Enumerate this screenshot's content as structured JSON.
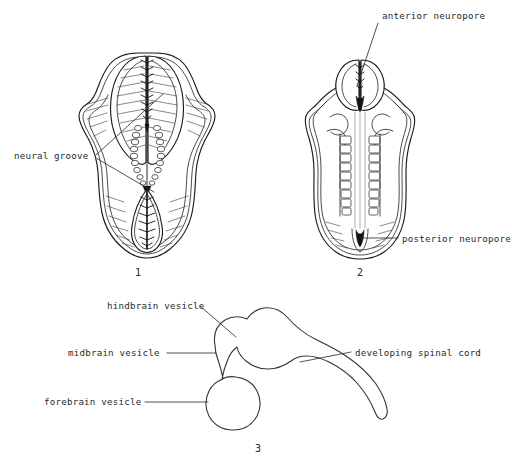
{
  "page": {
    "background_color": "#ffffff",
    "ink_color": "#1a1a1a",
    "width": 512,
    "height": 467
  },
  "figures": [
    {
      "id": "figure-1",
      "number": "1",
      "caption": "1",
      "description": "dorsal view of embryo with open neural groove and neural folds",
      "labels": [
        {
          "id": "neural-groove",
          "text": "neural groove",
          "text_x": 14,
          "text_y": 159,
          "anchor": "start",
          "leaders": [
            {
              "x1": 96,
              "y1": 155,
              "x2": 163,
              "y2": 94
            },
            {
              "x1": 96,
              "y1": 158,
              "x2": 154,
              "y2": 192
            }
          ]
        }
      ]
    },
    {
      "id": "figure-2",
      "number": "2",
      "caption": "2",
      "description": "dorsal view of embryo with closing neural tube, somites and neuropores",
      "labels": [
        {
          "id": "anterior-neuropore",
          "text": "anterior neuropore",
          "text_x": 382,
          "text_y": 19,
          "anchor": "start",
          "leaders": [
            {
              "x1": 378,
              "y1": 23,
              "x2": 357,
              "y2": 86
            }
          ]
        },
        {
          "id": "posterior-neuropore",
          "text": "posterior neuropore",
          "text_x": 402,
          "text_y": 242,
          "anchor": "start",
          "leaders": [
            {
              "x1": 398,
              "y1": 238,
              "x2": 360,
              "y2": 238
            }
          ]
        }
      ]
    },
    {
      "id": "figure-3",
      "number": "3",
      "caption": "3",
      "description": "lateral view of developing brain vesicles and spinal cord",
      "labels": [
        {
          "id": "hindbrain-vesicle",
          "text": "hindbrain vesicle",
          "text_x": 107,
          "text_y": 309,
          "anchor": "start",
          "leaders": [
            {
              "x1": 200,
              "y1": 306,
              "x2": 236,
              "y2": 337
            }
          ]
        },
        {
          "id": "midbrain-vesicle",
          "text": "midbrain vesicle",
          "text_x": 68,
          "text_y": 356,
          "anchor": "start",
          "leaders": [
            {
              "x1": 167,
              "y1": 353,
              "x2": 216,
              "y2": 353
            }
          ]
        },
        {
          "id": "forebrain-vesicle",
          "text": "forebrain vesicle",
          "text_x": 44,
          "text_y": 405,
          "anchor": "start",
          "leaders": [
            {
              "x1": 145,
              "y1": 402,
              "x2": 208,
              "y2": 402
            }
          ]
        },
        {
          "id": "developing-spinal-cord",
          "text": "developing spinal cord",
          "text_x": 355,
          "text_y": 356,
          "anchor": "start",
          "leaders": [
            {
              "x1": 351,
              "y1": 352,
              "x2": 300,
              "y2": 362
            }
          ]
        }
      ]
    }
  ],
  "figure_numbers": [
    {
      "id": "figure-number-1",
      "text": "1",
      "x": 138,
      "y": 276
    },
    {
      "id": "figure-number-2",
      "text": "2",
      "x": 360,
      "y": 276
    },
    {
      "id": "figure-number-3",
      "text": "3",
      "x": 258,
      "y": 452
    }
  ]
}
